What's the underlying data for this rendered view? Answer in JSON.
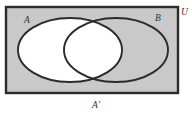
{
  "figure": {
    "type": "venn-diagram",
    "caption": "A'",
    "labels": {
      "set_a": "A",
      "set_b": "B",
      "universe": "U"
    },
    "colors": {
      "shaded_region": "#c9c9c9",
      "unshaded_region": "#ffffff",
      "outline": "#2b2b2b",
      "page_background": "#ffffff",
      "label_text": "#333333"
    },
    "geometry": {
      "rectangle": {
        "x": 6,
        "y": 7,
        "width": 172,
        "height": 86
      },
      "ellipse_a": {
        "cx": 70,
        "cy": 50,
        "rx": 52,
        "ry": 32
      },
      "ellipse_b": {
        "cx": 116,
        "cy": 50,
        "rx": 52,
        "ry": 32
      }
    },
    "shading": {
      "shaded_set": "A'",
      "meaning": "complement of A",
      "includes": [
        "U outside both A and B",
        "B only"
      ],
      "excludes": [
        "A only",
        "A intersect B"
      ]
    }
  }
}
